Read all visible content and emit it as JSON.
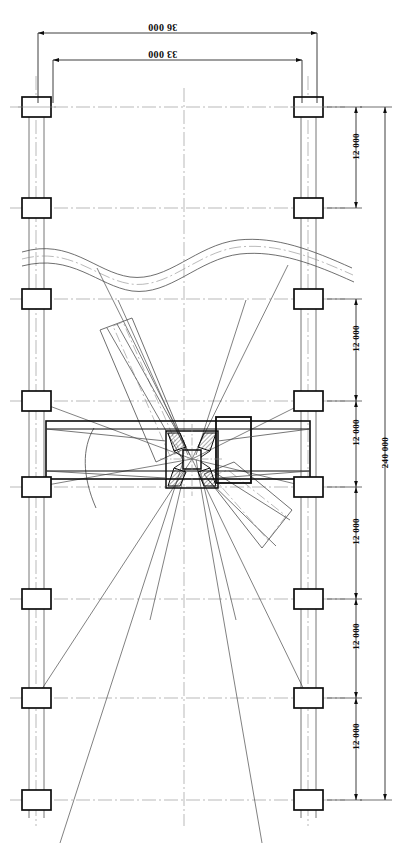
{
  "drawing": {
    "title": "Structural framing plan with rotating boom mechanism",
    "type": "engineering-plan",
    "units": "mm",
    "paper_color": "#ffffff",
    "line_color": "#0d0d0d",
    "thin_line_color": "#3a3a3a",
    "center_line_color": "#7a7a7a"
  },
  "dimensions": {
    "horizontal": [
      {
        "id": "dim-36000",
        "label": "36 000",
        "rotation": 180,
        "x1": 38,
        "x2": 317,
        "y": 33,
        "text_x": 148,
        "text_y": 28,
        "font_size": 10
      },
      {
        "id": "dim-33000",
        "label": "33 000",
        "rotation": 180,
        "x1": 53,
        "x2": 302,
        "y": 60,
        "text_x": 148,
        "text_y": 55,
        "font_size": 10
      }
    ],
    "vertical_chain": {
      "id": "dim-chain-12000",
      "axis_x": 356,
      "label": "12 000",
      "rotation": -90,
      "font_size": 9,
      "segments": [
        {
          "y1": 107,
          "y2": 208,
          "text_y": 146
        },
        {
          "y1": 299,
          "y2": 401,
          "text_y": 338
        },
        {
          "y1": 401,
          "y2": 487,
          "text_y": 432
        },
        {
          "y1": 487,
          "y2": 599,
          "text_y": 531
        },
        {
          "y1": 599,
          "y2": 698,
          "text_y": 636
        },
        {
          "y1": 698,
          "y2": 800,
          "text_y": 736
        }
      ]
    },
    "vertical_overall": {
      "id": "dim-240000",
      "label": "240 000",
      "rotation": -90,
      "axis_x": 385,
      "y1": 107,
      "y2": 800,
      "text_y": 452,
      "font_size": 9
    }
  },
  "grid": {
    "column_rows_y": [
      107,
      208,
      299,
      401,
      487,
      599,
      698,
      800
    ],
    "left_column_x": 22,
    "right_column_x": 294,
    "column_width": 29,
    "column_height": 20,
    "axis_left_x": 36,
    "axis_right_x": 308,
    "center_axis_x": 184
  },
  "features": {
    "roadway": {
      "name": "curved-roadway",
      "description": "S-curved road crossing the plan above the machine"
    },
    "beam": {
      "name": "horizontal-beam",
      "description": "Main horizontal girder spanning left to right through hub"
    },
    "hub": {
      "name": "central-rotating-hub",
      "description": "Square rotating hub with four hatched diagonal brackets"
    },
    "booms": [
      {
        "name": "boom-upper-left",
        "angle_deg": -52
      },
      {
        "name": "boom-lower-right",
        "angle_deg": 128
      }
    ],
    "machinery_box": {
      "name": "machinery-house",
      "description": "Heavy outlined equipment housing right of hub"
    },
    "swing_arc": {
      "name": "swing-radius-arc",
      "description": "Arc indicating boom swing clearance"
    },
    "radial_lines": {
      "name": "radial-sight-lines",
      "description": "Fan of straight lines radiating from the hub to grid corners"
    }
  }
}
